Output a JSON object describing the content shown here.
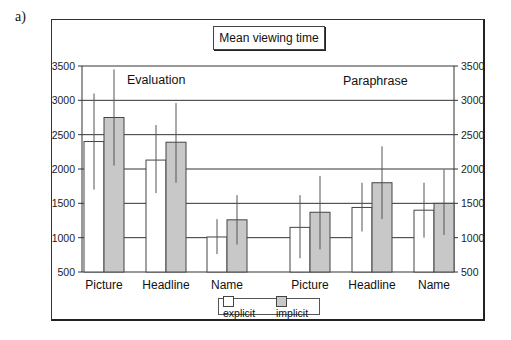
{
  "panel_label": "a)",
  "chart_title": "Mean viewing time",
  "group_labels": [
    "Evaluation",
    "Paraphrase"
  ],
  "legend": [
    {
      "label": "explicit",
      "color": "#ffffff"
    },
    {
      "label": "implicit",
      "color": "#c8c8c8"
    }
  ],
  "chart_data": {
    "type": "bar",
    "title": "Mean viewing time",
    "xlabel": "",
    "ylabel": "",
    "ylim": [
      500,
      3500
    ],
    "yticks": [
      500,
      1000,
      1500,
      2000,
      2500,
      3000,
      3500
    ],
    "y_axis_both_sides": true,
    "grid": true,
    "legend_position": "bottom",
    "groups": [
      "Evaluation",
      "Paraphrase"
    ],
    "categories": [
      "Picture",
      "Headline",
      "Name",
      "Picture",
      "Headline",
      "Name"
    ],
    "series": [
      {
        "name": "explicit",
        "values": [
          2400,
          2130,
          1010,
          1150,
          1440,
          1400
        ],
        "error_low": [
          1700,
          1650,
          760,
          700,
          1090,
          1000
        ],
        "error_high": [
          3100,
          2640,
          1270,
          1620,
          1800,
          1800
        ]
      },
      {
        "name": "implicit",
        "values": [
          2750,
          2390,
          1260,
          1370,
          1800,
          1500
        ],
        "error_low": [
          2050,
          1800,
          900,
          830,
          1270,
          1040
        ],
        "error_high": [
          3450,
          2960,
          1620,
          1900,
          2330,
          1990
        ]
      }
    ]
  }
}
